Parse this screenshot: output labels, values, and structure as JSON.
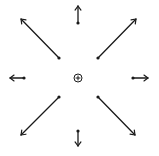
{
  "diagram": {
    "title": "",
    "stroke_color": "#1a1a1a",
    "background": "#ffffff",
    "center": {
      "x": 78,
      "y": 78,
      "icon": "circle-plus-icon",
      "radius": 4
    },
    "arrows": [
      {
        "direction": "up",
        "from": [
          78,
          23
        ],
        "to": [
          78,
          6
        ]
      },
      {
        "direction": "up-right",
        "from": [
          98,
          58
        ],
        "to": [
          136,
          19
        ]
      },
      {
        "direction": "right",
        "from": [
          133,
          78
        ],
        "to": [
          148,
          78
        ]
      },
      {
        "direction": "down-right",
        "from": [
          98,
          97
        ],
        "to": [
          135,
          135
        ]
      },
      {
        "direction": "down",
        "from": [
          78,
          131
        ],
        "to": [
          78,
          146
        ]
      },
      {
        "direction": "down-left",
        "from": [
          59,
          97
        ],
        "to": [
          21,
          135
        ]
      },
      {
        "direction": "left",
        "from": [
          24,
          78
        ],
        "to": [
          10,
          78
        ]
      },
      {
        "direction": "up-left",
        "from": [
          59,
          58
        ],
        "to": [
          21,
          19
        ]
      }
    ]
  }
}
